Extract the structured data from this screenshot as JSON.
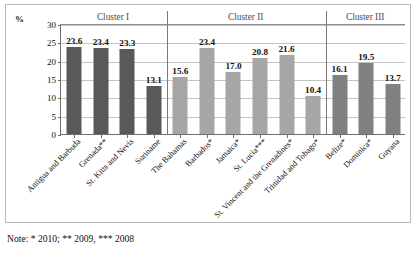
{
  "axis": {
    "unit_label": "%",
    "y_ticks": [
      "0",
      "5",
      "10",
      "15",
      "20",
      "25",
      "30"
    ]
  },
  "note": "Note: * 2010; ** 2009, *** 2008",
  "clusters": [
    {
      "label": "Cluster I"
    },
    {
      "label": "Cluster II"
    },
    {
      "label": "Cluster III"
    }
  ],
  "colors": {
    "cluster_1_bar": "#595959",
    "cluster_2_bar": "#a6a6a6",
    "cluster_3_bar": "#808080",
    "gridline": "#c4c4c4",
    "axis": "#6e6e6e"
  },
  "chart_data": {
    "type": "bar",
    "title": "",
    "xlabel": "",
    "ylabel": "%",
    "ylim": [
      0,
      30
    ],
    "yticks": [
      0,
      5,
      10,
      15,
      20,
      25,
      30
    ],
    "grid": true,
    "legend": "none",
    "categories": [
      "Antigua and Barbuda",
      "Grenada**",
      "St. Kitts and Nevis",
      "Suriname",
      "The Bahamas",
      "Barbados*",
      "Jamaica*",
      "St. Lucia***",
      "St. Vincent and the Grenadines*",
      "Trinidad and Tobago*",
      "Belize*",
      "Dominica*",
      "Guyana"
    ],
    "values": [
      23.6,
      23.4,
      23.3,
      13.1,
      15.6,
      23.4,
      17.0,
      20.8,
      21.6,
      10.4,
      16.1,
      19.5,
      13.7
    ],
    "value_labels": [
      "23.6",
      "23.4",
      "23.3",
      "13.1",
      "15.6",
      "23.4",
      "17.0",
      "20.8",
      "21.6",
      "10.4",
      "16.1",
      "19.5",
      "13.7"
    ],
    "groups": [
      {
        "name": "Cluster I",
        "start": 0,
        "count": 4,
        "color": "#595959"
      },
      {
        "name": "Cluster II",
        "start": 4,
        "count": 6,
        "color": "#a6a6a6"
      },
      {
        "name": "Cluster III",
        "start": 10,
        "count": 3,
        "color": "#808080"
      }
    ],
    "annotations": [
      "Note: * 2010; ** 2009, *** 2008"
    ]
  }
}
